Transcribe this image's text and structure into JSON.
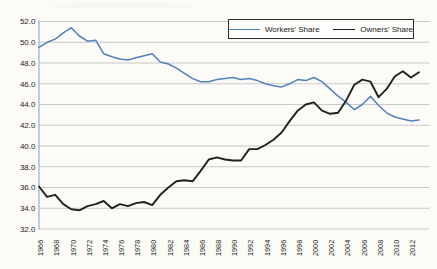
{
  "figure": {
    "background_color": "#fcfbf8",
    "gridline_color": "#c9c9c7",
    "axis_line_color": "#9fbcd8",
    "tick_label_color": "#1c1c1c",
    "legend_border_color": "#2b2b2b"
  },
  "chart_data": {
    "type": "line",
    "title": "",
    "xlabel": "",
    "ylabel": "",
    "x": [
      1966,
      1967,
      1968,
      1969,
      1970,
      1971,
      1972,
      1973,
      1974,
      1975,
      1976,
      1977,
      1978,
      1979,
      1980,
      1981,
      1982,
      1983,
      1984,
      1985,
      1986,
      1987,
      1988,
      1989,
      1990,
      1991,
      1992,
      1993,
      1994,
      1995,
      1996,
      1997,
      1998,
      1999,
      2000,
      2001,
      2002,
      2003,
      2004,
      2005,
      2006,
      2007,
      2008,
      2009,
      2010,
      2011,
      2012,
      2013
    ],
    "series": [
      {
        "name": "Workers' Share",
        "color": "#4f81bd",
        "values": [
          49.5,
          50.0,
          50.3,
          50.9,
          51.4,
          50.6,
          50.1,
          50.2,
          48.9,
          48.6,
          48.4,
          48.3,
          48.5,
          48.7,
          48.9,
          48.1,
          47.9,
          47.5,
          47.0,
          46.5,
          46.2,
          46.2,
          46.4,
          46.5,
          46.6,
          46.4,
          46.5,
          46.3,
          46.0,
          45.8,
          45.7,
          46.0,
          46.4,
          46.3,
          46.6,
          46.2,
          45.5,
          44.8,
          44.2,
          43.5,
          44.0,
          44.8,
          43.9,
          43.2,
          42.8,
          42.6,
          42.4,
          42.5
        ]
      },
      {
        "name": "Owners' Share",
        "color": "#212121",
        "values": [
          36.1,
          35.1,
          35.3,
          34.4,
          33.9,
          33.8,
          34.2,
          34.4,
          34.7,
          34.0,
          34.4,
          34.2,
          34.5,
          34.6,
          34.3,
          35.3,
          36.0,
          36.6,
          36.7,
          36.6,
          37.6,
          38.7,
          38.9,
          38.7,
          38.6,
          38.6,
          39.7,
          39.7,
          40.1,
          40.6,
          41.3,
          42.4,
          43.4,
          44.0,
          44.2,
          43.4,
          43.1,
          43.2,
          44.4,
          45.9,
          46.4,
          46.2,
          44.7,
          45.5,
          46.7,
          47.2,
          46.6,
          47.1
        ]
      }
    ],
    "ylim": [
      32.0,
      52.0
    ],
    "y_ticks": [
      "52.0",
      "50.0",
      "48.0",
      "46.0",
      "44.0",
      "42.0",
      "40.0",
      "38.0",
      "36.0",
      "34.0",
      "32.0"
    ],
    "x_ticks": [
      "1966",
      "1968",
      "1970",
      "1972",
      "1974",
      "1976",
      "1978",
      "1980",
      "1982",
      "1984",
      "1986",
      "1988",
      "1990",
      "1992",
      "1994",
      "1996",
      "1998",
      "2000",
      "2002",
      "2004",
      "2006",
      "2008",
      "2010",
      "2012"
    ],
    "x_tick_rotation_deg": -90,
    "grid": "horizontal",
    "legend_position": "top-right"
  }
}
